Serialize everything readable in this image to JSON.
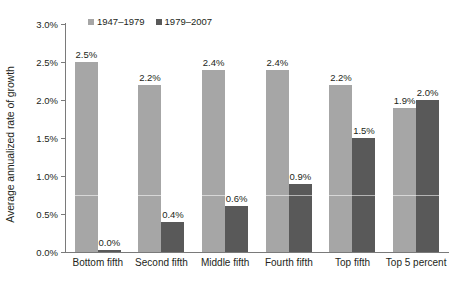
{
  "chart_data": {
    "type": "bar",
    "title": "",
    "xlabel": "",
    "ylabel": "Average annualized rate of growth",
    "ylim": [
      0.0,
      3.0
    ],
    "ytick_labels": [
      "0.0%",
      "0.5%",
      "1.0%",
      "1.5%",
      "2.0%",
      "2.5%",
      "3.0%"
    ],
    "ytick_values": [
      0.0,
      0.5,
      1.0,
      1.5,
      2.0,
      2.5,
      3.0
    ],
    "grid": false,
    "legend_position": "top-left",
    "categories": [
      "Bottom fifth",
      "Second fifth",
      "Middle fifth",
      "Fourth fifth",
      "Top fifth",
      "Top 5 percent"
    ],
    "series": [
      {
        "name": "1947–1979",
        "color": "#a6a6a6",
        "values": [
          2.5,
          2.2,
          2.4,
          2.4,
          2.2,
          1.9
        ],
        "labels": [
          "2.5%",
          "2.2%",
          "2.4%",
          "2.4%",
          "2.2%",
          "1.9%"
        ]
      },
      {
        "name": "1979–2007",
        "color": "#595959",
        "values": [
          0.0,
          0.4,
          0.6,
          0.9,
          1.5,
          2.0
        ],
        "labels": [
          "0.0%",
          "0.4%",
          "0.6%",
          "0.9%",
          "1.5%",
          "2.0%"
        ]
      }
    ]
  },
  "colors": {
    "series_1": "#a6a6a6",
    "series_2": "#595959",
    "axis": "#7a7a7a",
    "text": "#231f20",
    "background": "#ffffff"
  }
}
